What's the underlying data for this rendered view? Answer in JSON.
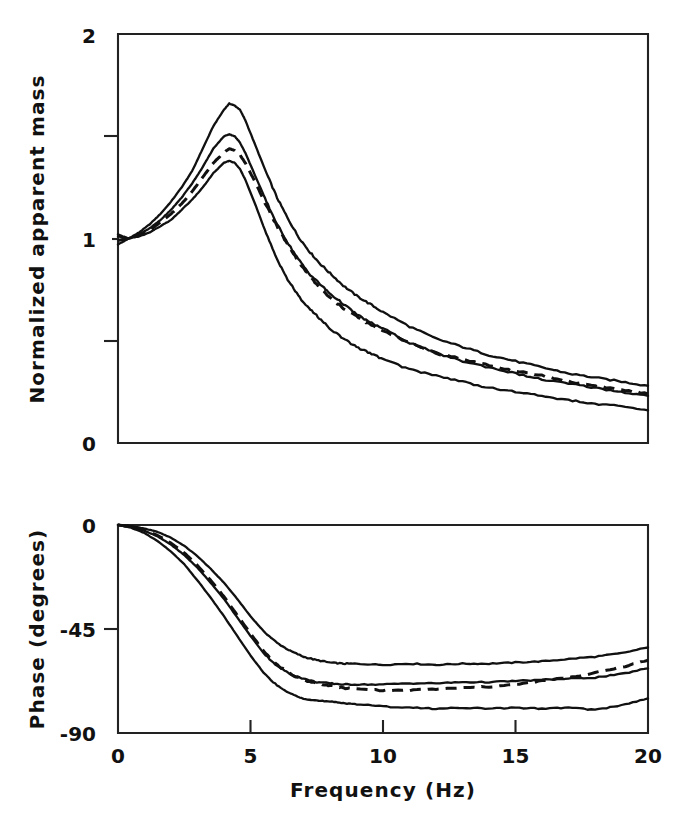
{
  "figure": {
    "background": "#ffffff",
    "ink_color": "#111111",
    "panels": 2
  },
  "chart_data": [
    {
      "type": "line",
      "panel": "top",
      "title": "",
      "xlabel": "Frequency  (Hz)",
      "ylabel": "Normalized apparent mass",
      "xlim": [
        0,
        20
      ],
      "ylim": [
        0,
        2
      ],
      "xticks": [
        0,
        5,
        10,
        15,
        20
      ],
      "xticklabels": [
        "0",
        "5",
        "10",
        "15",
        "20"
      ],
      "yticks": [
        0,
        0.5,
        1,
        1.5,
        2
      ],
      "yticklabels": [
        "0",
        "",
        "1",
        "",
        "2"
      ],
      "minor_yticks": [
        0.5,
        1.5
      ],
      "grid": false,
      "legend": "none",
      "x": [
        0.0,
        0.4,
        0.8,
        1.2,
        1.6,
        2.0,
        2.4,
        2.8,
        3.2,
        3.6,
        4.0,
        4.2,
        4.4,
        4.6,
        4.8,
        5.2,
        5.6,
        6.0,
        6.4,
        6.8,
        7.2,
        7.6,
        8.0,
        8.5,
        9.0,
        9.5,
        10.0,
        11.0,
        12.0,
        13.0,
        14.0,
        15.0,
        16.0,
        17.0,
        18.0,
        19.0,
        20.0
      ],
      "series": [
        {
          "name": "upper bound",
          "style": "solid",
          "values": [
            1.02,
            1.0,
            1.03,
            1.07,
            1.12,
            1.18,
            1.25,
            1.33,
            1.44,
            1.55,
            1.63,
            1.66,
            1.65,
            1.63,
            1.58,
            1.45,
            1.32,
            1.2,
            1.1,
            1.01,
            0.94,
            0.88,
            0.83,
            0.77,
            0.72,
            0.68,
            0.64,
            0.57,
            0.51,
            0.47,
            0.43,
            0.4,
            0.37,
            0.34,
            0.32,
            0.3,
            0.28
          ]
        },
        {
          "name": "middle bound",
          "style": "solid",
          "values": [
            1.01,
            1.0,
            1.02,
            1.05,
            1.09,
            1.14,
            1.2,
            1.27,
            1.35,
            1.44,
            1.5,
            1.51,
            1.5,
            1.47,
            1.42,
            1.3,
            1.18,
            1.07,
            0.98,
            0.9,
            0.83,
            0.78,
            0.73,
            0.68,
            0.63,
            0.59,
            0.56,
            0.49,
            0.44,
            0.4,
            0.37,
            0.34,
            0.31,
            0.29,
            0.27,
            0.25,
            0.23
          ]
        },
        {
          "name": "mean (model)",
          "style": "dashed",
          "values": [
            0.99,
            1.0,
            1.02,
            1.04,
            1.08,
            1.12,
            1.17,
            1.23,
            1.3,
            1.37,
            1.42,
            1.44,
            1.43,
            1.41,
            1.37,
            1.27,
            1.16,
            1.06,
            0.97,
            0.89,
            0.82,
            0.76,
            0.71,
            0.66,
            0.62,
            0.58,
            0.55,
            0.49,
            0.44,
            0.41,
            0.38,
            0.35,
            0.33,
            0.3,
            0.28,
            0.26,
            0.24
          ]
        },
        {
          "name": "lower bound",
          "style": "solid",
          "values": [
            0.97,
            1.0,
            1.01,
            1.03,
            1.06,
            1.09,
            1.14,
            1.19,
            1.25,
            1.32,
            1.37,
            1.38,
            1.37,
            1.34,
            1.29,
            1.16,
            1.02,
            0.9,
            0.8,
            0.72,
            0.66,
            0.61,
            0.56,
            0.51,
            0.47,
            0.44,
            0.41,
            0.36,
            0.33,
            0.3,
            0.27,
            0.25,
            0.23,
            0.21,
            0.19,
            0.18,
            0.16
          ]
        }
      ]
    },
    {
      "type": "line",
      "panel": "bottom",
      "title": "",
      "xlabel": "Frequency  (Hz)",
      "ylabel": "Phase  (degrees)",
      "xlim": [
        0,
        20
      ],
      "ylim": [
        -90,
        0
      ],
      "xticks": [
        0,
        5,
        10,
        15,
        20
      ],
      "xticklabels": [
        "0",
        "5",
        "10",
        "15",
        "20"
      ],
      "yticks": [
        -90,
        -45,
        0
      ],
      "yticklabels": [
        "-90",
        "-45",
        "0"
      ],
      "grid": false,
      "legend": "none",
      "x": [
        0.0,
        0.5,
        1.0,
        1.5,
        2.0,
        2.5,
        3.0,
        3.5,
        4.0,
        4.5,
        5.0,
        5.5,
        6.0,
        6.5,
        7.0,
        7.5,
        8.0,
        8.5,
        9.0,
        10.0,
        11.0,
        12.0,
        13.0,
        14.0,
        15.0,
        16.0,
        17.0,
        18.0,
        19.0,
        20.0
      ],
      "series": [
        {
          "name": "upper bound",
          "style": "solid",
          "values": [
            0.0,
            -0.5,
            -1.5,
            -3.0,
            -5.5,
            -9.0,
            -13.5,
            -19.0,
            -25.0,
            -32.0,
            -39.5,
            -46.0,
            -51.0,
            -54.5,
            -57.0,
            -58.5,
            -59.5,
            -60.0,
            -60.0,
            -60.5,
            -60.0,
            -60.5,
            -60.0,
            -60.0,
            -59.5,
            -59.0,
            -58.0,
            -57.0,
            -55.5,
            -53.0
          ]
        },
        {
          "name": "middle bound",
          "style": "solid",
          "values": [
            0.0,
            -0.8,
            -2.5,
            -5.0,
            -8.5,
            -13.0,
            -18.5,
            -25.0,
            -32.0,
            -40.0,
            -48.0,
            -55.5,
            -61.0,
            -64.5,
            -66.5,
            -68.0,
            -68.5,
            -69.0,
            -69.0,
            -69.0,
            -68.5,
            -68.5,
            -68.0,
            -68.0,
            -67.5,
            -67.0,
            -66.5,
            -66.0,
            -64.5,
            -62.0
          ]
        },
        {
          "name": "mean (model)",
          "style": "dashed",
          "values": [
            0.0,
            -0.7,
            -2.2,
            -4.5,
            -7.8,
            -12.0,
            -17.5,
            -24.0,
            -31.0,
            -39.0,
            -47.0,
            -54.5,
            -60.5,
            -64.5,
            -67.0,
            -68.5,
            -69.5,
            -70.5,
            -71.0,
            -71.5,
            -71.5,
            -71.0,
            -70.5,
            -70.0,
            -69.0,
            -67.5,
            -66.0,
            -64.0,
            -61.5,
            -58.5
          ]
        },
        {
          "name": "lower bound",
          "style": "solid",
          "values": [
            0.0,
            -1.2,
            -3.5,
            -7.0,
            -11.5,
            -17.0,
            -24.0,
            -31.5,
            -39.5,
            -48.0,
            -56.5,
            -64.0,
            -69.5,
            -73.0,
            -75.0,
            -76.0,
            -76.5,
            -77.0,
            -77.5,
            -78.5,
            -79.0,
            -79.5,
            -79.0,
            -79.5,
            -79.0,
            -79.5,
            -79.0,
            -80.0,
            -78.0,
            -75.0
          ]
        }
      ]
    }
  ],
  "top_panel": {
    "y_axis_title": "Normalized apparent mass",
    "y_tick_labels": {
      "max": "2",
      "mid": "1",
      "min": "0"
    }
  },
  "bottom_panel": {
    "y_axis_title": "Phase  (degrees)",
    "y_tick_labels": {
      "max": "0",
      "mid": "-45",
      "min": "-90"
    }
  },
  "x_axis": {
    "title": "Frequency  (Hz)",
    "labels": [
      "0",
      "5",
      "10",
      "15",
      "20"
    ]
  }
}
